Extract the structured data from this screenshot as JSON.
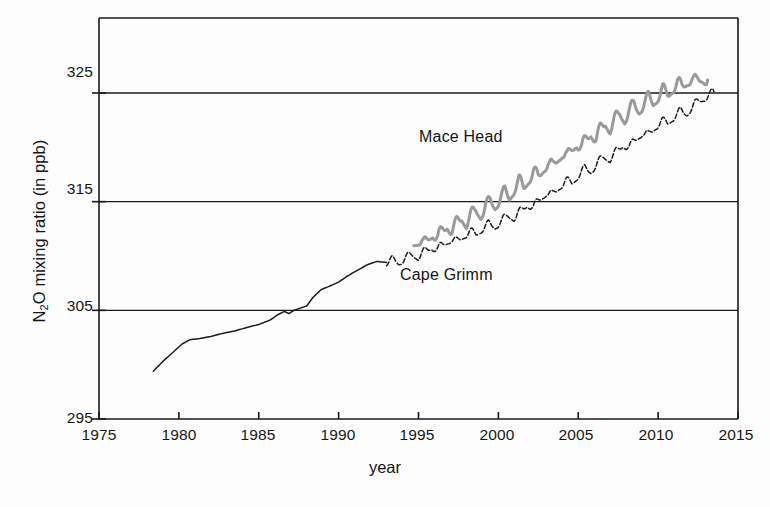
{
  "figure": {
    "background_color": "#fdfdfd",
    "axis_color": "#1a1a1a"
  },
  "chart_data": {
    "type": "line",
    "title": "",
    "xlabel": "year",
    "ylabel": "N2O mixing ratio (in ppb)",
    "ylabel_rich": {
      "prefix": "N",
      "subscript": "2",
      "suffix": "O mixing ratio (in ppb)"
    },
    "xlim": [
      1975,
      2015
    ],
    "ylim": [
      295,
      331.9
    ],
    "grid": "horizontal-only",
    "gridlines_y": [
      305,
      315,
      325
    ],
    "xticks": [
      1975,
      1980,
      1985,
      1990,
      1995,
      2000,
      2005,
      2010,
      2015
    ],
    "xtick_labels": [
      "1975",
      "1980",
      "1985",
      "1990",
      "1995",
      "2000",
      "2005",
      "2010",
      "2015"
    ],
    "yticks": [
      295,
      305,
      315,
      325
    ],
    "ytick_labels": [
      "295",
      "305",
      "315",
      "325"
    ],
    "legend": "inline-annotations",
    "annotations": [
      {
        "text": "Mace Head",
        "series": "mace-head",
        "x": 1995.1,
        "y": 320.0
      },
      {
        "text": "Cape Grimm",
        "series": "cape-grimm",
        "x": 1992.5,
        "y": 306.1
      }
    ],
    "series": [
      {
        "name": "Mace Head",
        "color": "#9a9a9a",
        "line_width": 3.0,
        "style": "solid-seasonal-oscillation",
        "x_start": 1994.7,
        "x_end": 2013.1,
        "y_start": 311.2,
        "y_end": 326.2,
        "seasonal_amplitude": 0.55,
        "points": [
          [
            1994.7,
            311.2
          ],
          [
            1995.0,
            311.5
          ],
          [
            1995.3,
            310.9
          ],
          [
            1995.6,
            311.6
          ],
          [
            1995.9,
            312.1
          ],
          [
            1996.2,
            311.6
          ],
          [
            1996.5,
            312.3
          ],
          [
            1996.8,
            312.8
          ],
          [
            1997.1,
            312.3
          ],
          [
            1997.4,
            313.0
          ],
          [
            1997.7,
            313.5
          ],
          [
            1998.0,
            313.0
          ],
          [
            1998.3,
            313.7
          ],
          [
            1998.6,
            314.2
          ],
          [
            1998.9,
            313.8
          ],
          [
            1999.2,
            314.5
          ],
          [
            1999.5,
            315.0
          ],
          [
            1999.8,
            314.6
          ],
          [
            2000.1,
            315.3
          ],
          [
            2000.4,
            315.8
          ],
          [
            2000.7,
            315.4
          ],
          [
            2001.0,
            316.2
          ],
          [
            2001.3,
            316.8
          ],
          [
            2001.6,
            316.3
          ],
          [
            2001.9,
            317.1
          ],
          [
            2002.2,
            317.7
          ],
          [
            2002.5,
            317.2
          ],
          [
            2002.8,
            318.0
          ],
          [
            2003.1,
            318.6
          ],
          [
            2003.4,
            318.1
          ],
          [
            2003.7,
            318.9
          ],
          [
            2004.0,
            319.5
          ],
          [
            2004.3,
            319.0
          ],
          [
            2004.6,
            319.8
          ],
          [
            2004.9,
            320.4
          ],
          [
            2005.2,
            319.9
          ],
          [
            2005.5,
            320.7
          ],
          [
            2005.8,
            321.3
          ],
          [
            2006.1,
            320.8
          ],
          [
            2006.4,
            321.6
          ],
          [
            2006.7,
            322.2
          ],
          [
            2007.0,
            321.7
          ],
          [
            2007.3,
            322.5
          ],
          [
            2007.6,
            323.1
          ],
          [
            2007.9,
            322.6
          ],
          [
            2008.2,
            323.3
          ],
          [
            2008.5,
            323.9
          ],
          [
            2008.8,
            323.4
          ],
          [
            2009.1,
            324.0
          ],
          [
            2009.4,
            324.5
          ],
          [
            2009.7,
            324.1
          ],
          [
            2010.0,
            324.7
          ],
          [
            2010.3,
            325.2
          ],
          [
            2010.6,
            324.8
          ],
          [
            2010.9,
            325.4
          ],
          [
            2011.2,
            325.9
          ],
          [
            2011.5,
            325.5
          ],
          [
            2011.8,
            326.0
          ],
          [
            2012.1,
            326.4
          ],
          [
            2012.4,
            325.9
          ],
          [
            2012.7,
            326.3
          ],
          [
            2013.1,
            326.2
          ]
        ]
      },
      {
        "name": "Cape Grimm",
        "color": "#1c1c1c",
        "line_width": 1.5,
        "style": "smooth-then-dashed-seasonal",
        "x_start": 1978.4,
        "x_end": 2013.5,
        "y_start": 299.4,
        "y_end": 325.1,
        "smooth_until": 1993.0,
        "seasonal_amplitude": 0.35,
        "points": [
          [
            1978.4,
            299.4
          ],
          [
            1979.0,
            300.3
          ],
          [
            1979.6,
            301.1
          ],
          [
            1980.2,
            301.9
          ],
          [
            1980.7,
            302.3
          ],
          [
            1981.3,
            302.4
          ],
          [
            1982.0,
            302.6
          ],
          [
            1982.8,
            302.9
          ],
          [
            1983.5,
            303.1
          ],
          [
            1984.2,
            303.4
          ],
          [
            1985.0,
            303.7
          ],
          [
            1985.7,
            304.1
          ],
          [
            1986.2,
            304.6
          ],
          [
            1986.6,
            304.9
          ],
          [
            1986.9,
            304.7
          ],
          [
            1987.2,
            305.0
          ],
          [
            1987.6,
            305.2
          ],
          [
            1988.0,
            305.4
          ],
          [
            1988.4,
            306.2
          ],
          [
            1988.9,
            306.9
          ],
          [
            1989.4,
            307.2
          ],
          [
            1990.0,
            307.6
          ],
          [
            1990.6,
            308.2
          ],
          [
            1991.2,
            308.7
          ],
          [
            1991.8,
            309.2
          ],
          [
            1992.4,
            309.5
          ],
          [
            1993.0,
            309.4
          ],
          [
            1993.4,
            309.6
          ],
          [
            1993.8,
            309.4
          ],
          [
            1994.2,
            309.8
          ],
          [
            1994.6,
            310.1
          ],
          [
            1995.0,
            309.9
          ],
          [
            1995.4,
            310.4
          ],
          [
            1995.8,
            310.8
          ],
          [
            1996.2,
            310.6
          ],
          [
            1996.6,
            311.1
          ],
          [
            1997.0,
            311.5
          ],
          [
            1997.4,
            311.3
          ],
          [
            1997.8,
            311.8
          ],
          [
            1998.2,
            312.2
          ],
          [
            1998.6,
            312.0
          ],
          [
            1999.0,
            312.5
          ],
          [
            1999.4,
            312.9
          ],
          [
            1999.8,
            312.7
          ],
          [
            2000.2,
            313.2
          ],
          [
            2000.6,
            313.7
          ],
          [
            2001.0,
            313.5
          ],
          [
            2001.4,
            314.1
          ],
          [
            2001.8,
            314.7
          ],
          [
            2002.2,
            314.5
          ],
          [
            2002.6,
            315.2
          ],
          [
            2003.0,
            315.8
          ],
          [
            2003.4,
            315.6
          ],
          [
            2003.8,
            316.3
          ],
          [
            2004.2,
            316.9
          ],
          [
            2004.6,
            316.7
          ],
          [
            2005.0,
            317.4
          ],
          [
            2005.4,
            318.0
          ],
          [
            2005.8,
            317.8
          ],
          [
            2006.2,
            318.5
          ],
          [
            2006.6,
            319.1
          ],
          [
            2007.0,
            318.9
          ],
          [
            2007.4,
            319.6
          ],
          [
            2007.8,
            320.2
          ],
          [
            2008.2,
            320.0
          ],
          [
            2008.6,
            320.7
          ],
          [
            2009.0,
            321.3
          ],
          [
            2009.4,
            321.1
          ],
          [
            2009.8,
            321.8
          ],
          [
            2010.2,
            322.4
          ],
          [
            2010.6,
            322.2
          ],
          [
            2011.0,
            322.8
          ],
          [
            2011.4,
            323.3
          ],
          [
            2011.8,
            323.1
          ],
          [
            2012.2,
            323.8
          ],
          [
            2012.6,
            324.3
          ],
          [
            2013.0,
            324.6
          ],
          [
            2013.5,
            325.1
          ]
        ]
      }
    ]
  },
  "geometry": {
    "plot_left": 99,
    "plot_right": 738,
    "plot_top": 18,
    "plot_bottom": 419
  }
}
